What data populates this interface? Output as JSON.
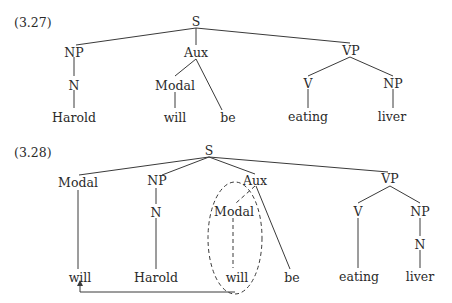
{
  "diagrams": [
    {
      "label": "(3.27)",
      "nodes": {
        "S": "S",
        "NP": "NP",
        "Aux": "Aux",
        "VP": "VP",
        "N": "N",
        "Modal": "Modal",
        "V": "V",
        "NP2": "NP",
        "Harold": "Harold",
        "will": "will",
        "be": "be",
        "eating": "eating",
        "liver": "liver"
      }
    },
    {
      "label": "(3.28)",
      "nodes": {
        "S": "S",
        "Modal_moved": "Modal",
        "NP": "NP",
        "Aux": "Aux",
        "VP": "VP",
        "N": "N",
        "Modal_trace": "Modal",
        "V": "V",
        "NP2": "NP",
        "N2": "N",
        "will_moved": "will",
        "Harold": "Harold",
        "will_trace": "will",
        "be": "be",
        "eating": "eating",
        "liver": "liver"
      },
      "annotations": {
        "dashed_ellipse": "encircles the original Modal/will position under Aux",
        "arrow": "movement arrow from the circled will to the fronted will"
      }
    }
  ]
}
